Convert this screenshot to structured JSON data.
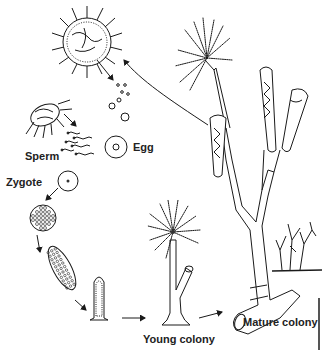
{
  "diagram": {
    "stages": [
      {
        "id": "medusa",
        "label": ""
      },
      {
        "id": "sperm",
        "label": "Sperm"
      },
      {
        "id": "egg",
        "label": "Egg"
      },
      {
        "id": "zygote",
        "label": "Zygote"
      },
      {
        "id": "blastula",
        "label": ""
      },
      {
        "id": "planula",
        "label": ""
      },
      {
        "id": "settled-polyp",
        "label": ""
      },
      {
        "id": "young-colony",
        "label": "Young colony"
      },
      {
        "id": "mature-colony",
        "label": "Mature colony"
      }
    ],
    "labels": {
      "sperm": "Sperm",
      "egg": "Egg",
      "zygote": "Zygote",
      "young_colony": "Young colony",
      "mature_colony": "Mature colony"
    },
    "arrows": [
      {
        "from": "mature-colony",
        "to": "medusa"
      },
      {
        "from": "medusa",
        "to": "egg"
      },
      {
        "from": "sperm",
        "to": "sperm"
      },
      {
        "from": "zygote",
        "to": "blastula"
      },
      {
        "from": "blastula",
        "to": "planula"
      },
      {
        "from": "planula",
        "to": "settled-polyp"
      },
      {
        "from": "settled-polyp",
        "to": "young-colony"
      },
      {
        "from": "young-colony",
        "to": "mature-colony"
      }
    ],
    "colors": {
      "ink": "#1a1a1a",
      "background": "#ffffff"
    }
  }
}
